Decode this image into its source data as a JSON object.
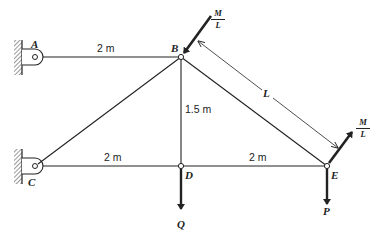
{
  "figure": {
    "type": "truss",
    "nodes": {
      "A": {
        "label": "A",
        "support": "pin-wall"
      },
      "B": {
        "label": "B"
      },
      "C": {
        "label": "C",
        "support": "pin-wall"
      },
      "D": {
        "label": "D"
      },
      "E": {
        "label": "E"
      }
    },
    "members": [
      "A-B",
      "B-C",
      "B-D",
      "C-D",
      "D-E",
      "B-E"
    ],
    "dimensions": {
      "AB": "2 m",
      "CD": "2 m",
      "DE": "2 m",
      "BD": "1.5 m",
      "BE": "L"
    },
    "loads": {
      "B_moment_load": {
        "numerator": "M",
        "denominator": "L"
      },
      "E_moment_load": {
        "numerator": "M",
        "denominator": "L"
      },
      "D_load": "Q",
      "E_load": "P"
    },
    "colors": {
      "line": "#222222",
      "background": "#ffffff"
    }
  }
}
